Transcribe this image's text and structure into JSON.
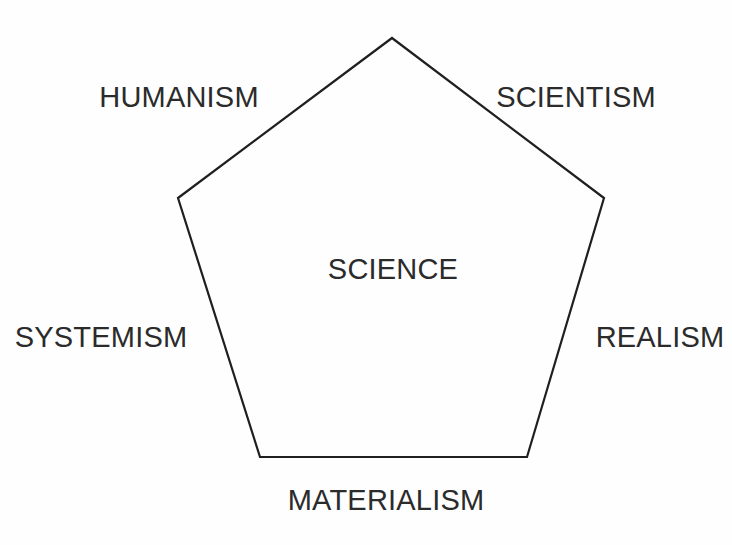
{
  "diagram": {
    "type": "pentagon-concept-diagram",
    "center_label": "SCIENCE",
    "vertex_labels": [
      "HUMANISM",
      "SCIENTISM",
      "REALISM",
      "MATERIALISM",
      "SYSTEMISM"
    ],
    "labels": {
      "humanism": "HUMANISM",
      "scientism": "SCIENTISM",
      "realism": "REALISM",
      "materialism": "MATERIALISM",
      "systemism": "SYSTEMISM",
      "science": "SCIENCE"
    },
    "colors": {
      "background": "#fefefe",
      "stroke": "#1f1f1f",
      "text": "#2b2b2b"
    },
    "geometry": {
      "stroke_width": 2.2,
      "points": "392,38 604,198 527,457 260,457 178,198",
      "vertices": [
        {
          "name": "top",
          "x": 392,
          "y": 38
        },
        {
          "name": "upper-right",
          "x": 604,
          "y": 198
        },
        {
          "name": "lower-right",
          "x": 527,
          "y": 457
        },
        {
          "name": "lower-left",
          "x": 260,
          "y": 457
        },
        {
          "name": "upper-left",
          "x": 178,
          "y": 198
        }
      ]
    }
  }
}
